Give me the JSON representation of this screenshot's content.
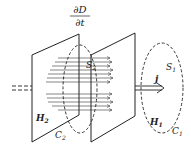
{
  "diagram": {
    "title_numerator": "∂D",
    "title_denominator": "∂t",
    "labels": {
      "S1": {
        "main": "S",
        "sub": "1"
      },
      "S2": {
        "main": "S",
        "sub": "2"
      },
      "H1": {
        "main": "H",
        "sub": "1"
      },
      "H2": {
        "main": "H",
        "sub": "2"
      },
      "C1": {
        "main": "C",
        "sub": "1"
      },
      "C2": {
        "main": "C",
        "sub": "2"
      },
      "j": "j"
    },
    "colors": {
      "stroke": "#222222",
      "background": "#ffffff"
    }
  }
}
